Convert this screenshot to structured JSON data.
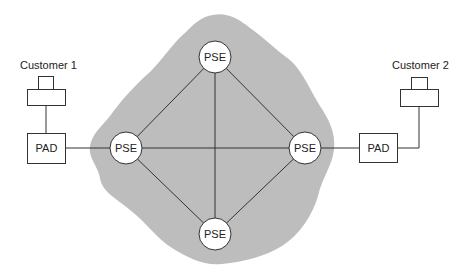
{
  "diagram": {
    "type": "network-topology",
    "cloud": {
      "fill": "#bdbdbd",
      "label": ""
    },
    "nodes": {
      "pse_top": {
        "label": "PSE",
        "cx": 215,
        "cy": 57
      },
      "pse_left": {
        "label": "PSE",
        "cx": 126,
        "cy": 148
      },
      "pse_right": {
        "label": "PSE",
        "cx": 305,
        "cy": 148
      },
      "pse_bottom": {
        "label": "PSE",
        "cx": 215,
        "cy": 234
      },
      "pad_left": {
        "label": "PAD"
      },
      "pad_right": {
        "label": "PAD"
      }
    },
    "customers": [
      {
        "label": "Customer 1"
      },
      {
        "label": "Customer 2"
      }
    ],
    "links": [
      [
        "pse_top",
        "pse_left"
      ],
      [
        "pse_top",
        "pse_right"
      ],
      [
        "pse_top",
        "pse_bottom"
      ],
      [
        "pse_left",
        "pse_right"
      ],
      [
        "pse_left",
        "pse_bottom"
      ],
      [
        "pse_right",
        "pse_bottom"
      ],
      [
        "pad_left",
        "pse_left"
      ],
      [
        "pad_right",
        "pse_right"
      ],
      [
        "customer_1",
        "pad_left"
      ],
      [
        "customer_2",
        "pad_right"
      ]
    ],
    "colors": {
      "line": "#333333",
      "node_fill": "#ffffff",
      "node_stroke": "#333333"
    }
  }
}
